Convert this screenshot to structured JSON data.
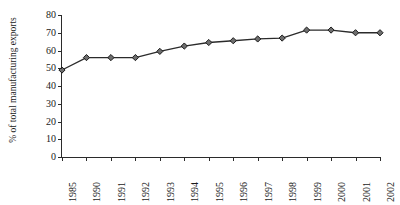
{
  "chart_data": {
    "type": "line",
    "title": "",
    "subtitle": "",
    "xlabel": "",
    "ylabel": "% of total manufacturing exports",
    "categories": [
      "1985",
      "1990",
      "1991",
      "1992",
      "1993",
      "1994",
      "1995",
      "1996",
      "1997",
      "1998",
      "1999",
      "2000",
      "2001",
      "2002"
    ],
    "series": [
      {
        "name": "",
        "values": [
          49,
          56,
          56,
          56,
          59.5,
          62.5,
          64.5,
          65.5,
          66.5,
          67,
          71.5,
          71.5,
          70,
          70
        ]
      }
    ],
    "ylim": [
      0,
      80
    ],
    "yticks": [
      0,
      10,
      20,
      30,
      40,
      50,
      60,
      70,
      80
    ],
    "ytick_labels": [
      "0",
      "10",
      "20",
      "30",
      "40",
      "50",
      "60",
      "70",
      "80"
    ],
    "grid": false,
    "legend": "none",
    "marker": "diamond",
    "line_color": "#2b2b2b",
    "marker_fill": "#6e6e6e",
    "marker_stroke": "#1a1a1a",
    "axis_color": "#2b2b2b",
    "background": "#ffffff"
  }
}
